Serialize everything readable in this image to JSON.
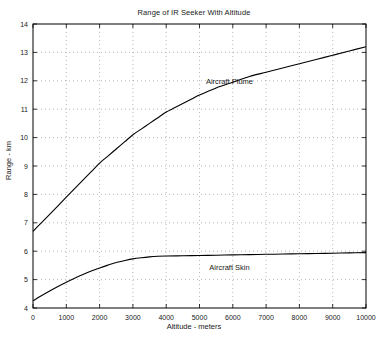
{
  "chart_data": {
    "type": "line",
    "title": "Range of IR Seeker With Altitude",
    "xlabel": "Altitude - meters",
    "ylabel": "Range - km",
    "xlim": [
      0,
      10000
    ],
    "ylim": [
      4,
      14
    ],
    "xticks": [
      0,
      1000,
      2000,
      3000,
      4000,
      5000,
      6000,
      7000,
      8000,
      9000,
      10000
    ],
    "xticklabels": [
      "0",
      "1000",
      "2000",
      "3000",
      "4000",
      "5000",
      "6000",
      "7000",
      "8000",
      "9000",
      "10000"
    ],
    "yticks": [
      4,
      5,
      6,
      7,
      8,
      9,
      10,
      11,
      12,
      13,
      14
    ],
    "yticklabels": [
      "4",
      "5",
      "6",
      "7",
      "8",
      "9",
      "10",
      "11",
      "12",
      "13",
      "14"
    ],
    "grid": true,
    "grid_style": "dotted",
    "grid_color": "#9a9a9a",
    "legend": "annotations",
    "line_color": "#000000",
    "series": [
      {
        "name": "Aircraft Plume",
        "annotation": "Aircraft Plume",
        "annotation_x": 5900,
        "annotation_y": 11.9,
        "x": [
          0,
          250,
          500,
          750,
          1000,
          1250,
          1500,
          1750,
          2000,
          2250,
          2500,
          2750,
          3000,
          3250,
          3500,
          3750,
          4000,
          4250,
          4500,
          4750,
          5000,
          5500,
          6000,
          6500,
          7000,
          7500,
          8000,
          8500,
          9000,
          9500,
          10000
        ],
        "values": [
          6.7,
          7.0,
          7.3,
          7.6,
          7.9,
          8.2,
          8.5,
          8.8,
          9.1,
          9.35,
          9.6,
          9.85,
          10.1,
          10.3,
          10.5,
          10.7,
          10.9,
          11.05,
          11.2,
          11.35,
          11.5,
          11.75,
          11.95,
          12.15,
          12.3,
          12.45,
          12.6,
          12.75,
          12.9,
          13.05,
          13.2
        ]
      },
      {
        "name": "Aircraft Skin",
        "annotation": "Aircraft Skin",
        "annotation_x": 5900,
        "annotation_y": 5.35,
        "x": [
          0,
          250,
          500,
          750,
          1000,
          1250,
          1500,
          1750,
          2000,
          2250,
          2500,
          2750,
          3000,
          3250,
          3500,
          3750,
          4000,
          4500,
          5000,
          5500,
          6000,
          6500,
          7000,
          7500,
          8000,
          8500,
          9000,
          9500,
          10000
        ],
        "values": [
          4.25,
          4.43,
          4.6,
          4.76,
          4.91,
          5.05,
          5.18,
          5.3,
          5.41,
          5.51,
          5.6,
          5.67,
          5.73,
          5.77,
          5.8,
          5.82,
          5.83,
          5.84,
          5.85,
          5.86,
          5.87,
          5.88,
          5.89,
          5.9,
          5.91,
          5.92,
          5.93,
          5.94,
          5.95
        ]
      }
    ]
  }
}
